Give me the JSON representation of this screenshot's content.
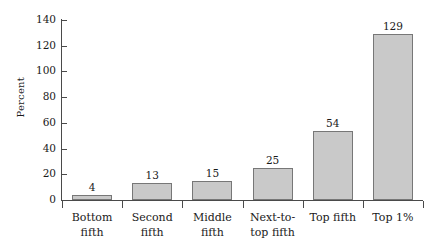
{
  "chart_data": {
    "type": "bar",
    "title": "",
    "xlabel": "",
    "ylabel": "Percent",
    "ylim": [
      0,
      140
    ],
    "ytick_values": [
      140,
      120,
      100,
      80,
      60,
      40,
      20,
      0
    ],
    "ytick_labels": [
      "140",
      "120",
      "100",
      "80",
      "60",
      "40",
      "20",
      "0"
    ],
    "grid": false,
    "legend": null,
    "bar_color": "#c9c9c9",
    "bar_border_color": "#777777",
    "axis_color": "#4a4a4a",
    "categories": [
      "Bottom fifth",
      "Second fifth",
      "Middle fifth",
      "Next-to-top fifth",
      "Top fifth",
      "Top 1%"
    ],
    "category_label_lines": [
      [
        "Bottom",
        "fifth"
      ],
      [
        "Second",
        "fifth"
      ],
      [
        "Middle",
        "fifth"
      ],
      [
        "Next-to-",
        "top fifth"
      ],
      [
        "Top fifth"
      ],
      [
        "Top 1%"
      ]
    ],
    "values": [
      4,
      13,
      15,
      25,
      54,
      129
    ],
    "value_labels": [
      "4",
      "13",
      "15",
      "25",
      "54",
      "129"
    ]
  }
}
